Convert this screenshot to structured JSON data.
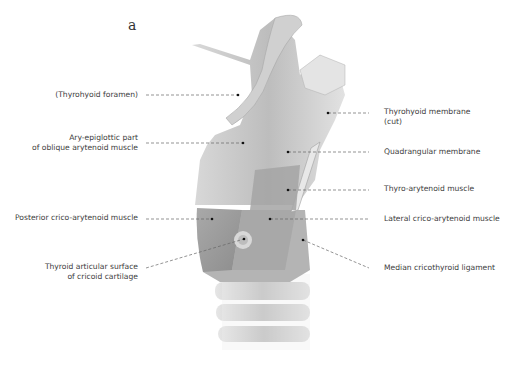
{
  "figure": {
    "panel_letter": "a",
    "labels_left": [
      {
        "id": "thyrohyoid-foramen",
        "lines": [
          "(Thyrohyoid foramen)"
        ]
      },
      {
        "id": "ary-epiglottic",
        "lines": [
          "Ary-epiglottic part",
          "of oblique arytenoid muscle"
        ]
      },
      {
        "id": "posterior-crico-arytenoid",
        "lines": [
          "Posterior crico-arytenoid muscle"
        ]
      },
      {
        "id": "thyroid-articular-surface",
        "lines": [
          "Thyroid articular surface",
          "of cricoid cartilage"
        ]
      }
    ],
    "labels_right": [
      {
        "id": "thyrohyoid-membrane",
        "lines": [
          "Thyrohyoid membrane",
          "(cut)"
        ]
      },
      {
        "id": "quadrangular-membrane",
        "lines": [
          "Quadrangular membrane"
        ]
      },
      {
        "id": "thyro-arytenoid",
        "lines": [
          "Thyro-arytenoid muscle"
        ]
      },
      {
        "id": "lateral-crico-arytenoid",
        "lines": [
          "Lateral crico-arytenoid muscle"
        ]
      },
      {
        "id": "median-cricothyroid-ligament",
        "lines": [
          "Median cricothyroid ligament"
        ]
      }
    ]
  }
}
